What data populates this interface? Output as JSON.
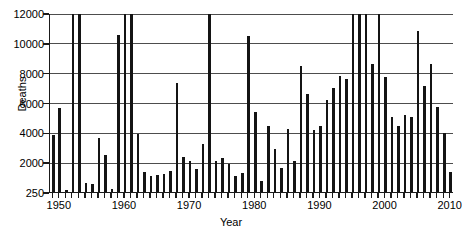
{
  "chart_data": {
    "type": "bar",
    "title": "",
    "xlabel": "Year",
    "ylabel": "Deaths",
    "xlim": [
      1948.5,
      2010.5
    ],
    "ylim": [
      250,
      12000
    ],
    "grid": true,
    "legend": false,
    "legend_position": "none",
    "y_axis_note": "Baseline tick is 250; remaining ticks are evenly spaced from 2000 to 12000. Bars reaching the top edge are clipped at 12000.",
    "yticks": [
      250,
      2000,
      4000,
      6000,
      8000,
      10000,
      12000
    ],
    "ytick_labels": [
      "250",
      "2000",
      "4000",
      "6000",
      "8000",
      "10000",
      "12000"
    ],
    "xticks": [
      1950,
      1960,
      1970,
      1980,
      1990,
      2000,
      2010
    ],
    "xtick_labels": [
      "1950",
      "1960",
      "1970",
      "1980",
      "1990",
      "2000",
      "2010"
    ],
    "bar_color": "#141414",
    "grid_color": "#4d4d4d",
    "axis_color": "#1a1a1a",
    "categories": [
      1949,
      1950,
      1951,
      1952,
      1953,
      1954,
      1955,
      1956,
      1957,
      1958,
      1959,
      1960,
      1961,
      1962,
      1963,
      1964,
      1965,
      1966,
      1967,
      1968,
      1969,
      1970,
      1971,
      1972,
      1973,
      1974,
      1975,
      1976,
      1977,
      1978,
      1979,
      1980,
      1981,
      1982,
      1983,
      1984,
      1985,
      1986,
      1987,
      1988,
      1989,
      1990,
      1991,
      1992,
      1993,
      1994,
      1995,
      1996,
      1997,
      1998,
      1999,
      2000,
      2001,
      2002,
      2003,
      2004,
      2005,
      2006,
      2007,
      2008,
      2009,
      2010
    ],
    "values": [
      3800,
      5600,
      350,
      12000,
      12000,
      800,
      700,
      3600,
      2450,
      450,
      10500,
      12000,
      12000,
      3900,
      1450,
      1200,
      1250,
      1300,
      1500,
      7300,
      2350,
      2050,
      1600,
      3250,
      12000,
      2100,
      2250,
      1900,
      1200,
      1350,
      10450,
      5350,
      900,
      4450,
      2900,
      1650,
      4200,
      2050,
      8450,
      6600,
      4150,
      4400,
      6200,
      6950,
      7800,
      7600,
      12000,
      12000,
      12000,
      8600,
      12000,
      7700,
      5000,
      4400,
      5150,
      5050,
      10800,
      7100,
      8600,
      5700,
      3950,
      1400
    ],
    "clipped_years": [
      1952,
      1953,
      1960,
      1961,
      1973,
      1995,
      1996,
      1997,
      1999
    ]
  }
}
